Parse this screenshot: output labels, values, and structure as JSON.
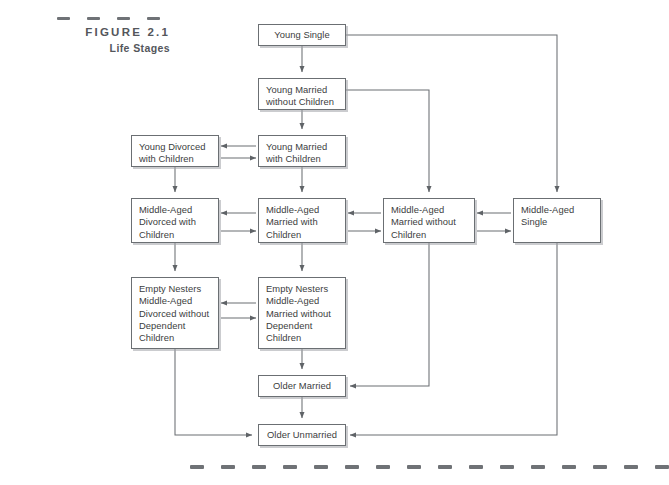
{
  "figure": {
    "label": "FIGURE 2.1",
    "title": "Life Stages"
  },
  "decor": {
    "top_rule_dashes": 4,
    "bottom_rule_dashes": 16,
    "dash_color": "#6f7276"
  },
  "theme": {
    "box_border": "#6b6f73",
    "box_shadow": "#a0a3a7",
    "text": "#3b3d40",
    "connector": "#6b6f73",
    "background": "#ffffff"
  },
  "diagram": {
    "type": "flowchart",
    "title": "Life Stages",
    "nodes": [
      {
        "id": "young-single",
        "label": "Young Single",
        "lines": [
          "Young Single"
        ],
        "x": 258,
        "y": 24,
        "w": 88,
        "h": 22,
        "align": "center"
      },
      {
        "id": "young-married-without-children",
        "label": "Young Married without Children",
        "lines": [
          "Young Married",
          "without Children"
        ],
        "x": 258,
        "y": 78,
        "w": 88,
        "h": 32,
        "align": "left"
      },
      {
        "id": "young-married-with-children",
        "label": "Young Married with Children",
        "lines": [
          "Young Married",
          "with Children"
        ],
        "x": 258,
        "y": 135,
        "w": 88,
        "h": 32,
        "align": "left"
      },
      {
        "id": "young-divorced-with-children",
        "label": "Young Divorced with Children",
        "lines": [
          "Young Divorced",
          "with Children"
        ],
        "x": 131,
        "y": 135,
        "w": 88,
        "h": 32,
        "align": "left"
      },
      {
        "id": "middle-aged-divorced-with-children",
        "label": "Middle-Aged Divorced with Children",
        "lines": [
          "Middle-Aged",
          "Divorced with",
          "Children"
        ],
        "x": 131,
        "y": 198,
        "w": 88,
        "h": 45,
        "align": "left"
      },
      {
        "id": "middle-aged-married-with-children",
        "label": "Middle-Aged Married with Children",
        "lines": [
          "Middle-Aged",
          "Married with",
          "Children"
        ],
        "x": 258,
        "y": 198,
        "w": 88,
        "h": 45,
        "align": "left"
      },
      {
        "id": "middle-aged-married-without-children",
        "label": "Middle-Aged Married without Children",
        "lines": [
          "Middle-Aged",
          "Married without",
          "Children"
        ],
        "x": 383,
        "y": 198,
        "w": 92,
        "h": 45,
        "align": "left"
      },
      {
        "id": "middle-aged-single",
        "label": "Middle-Aged Single",
        "lines": [
          "Middle-Aged",
          "Single"
        ],
        "x": 513,
        "y": 198,
        "w": 88,
        "h": 45,
        "align": "left"
      },
      {
        "id": "empty-nesters-divorced",
        "label": "Empty Nesters Middle-Aged Divorced without Dependent Children",
        "lines": [
          "Empty Nesters",
          "Middle-Aged",
          "Divorced without",
          "Dependent",
          "Children"
        ],
        "x": 131,
        "y": 277,
        "w": 88,
        "h": 72,
        "align": "left"
      },
      {
        "id": "empty-nesters-married",
        "label": "Empty Nesters Middle-Aged Married without Dependent Children",
        "lines": [
          "Empty Nesters",
          "Middle-Aged",
          "Married without",
          "Dependent",
          "Children"
        ],
        "x": 258,
        "y": 277,
        "w": 88,
        "h": 72,
        "align": "left"
      },
      {
        "id": "older-married",
        "label": "Older Married",
        "lines": [
          "Older Married"
        ],
        "x": 258,
        "y": 375,
        "w": 88,
        "h": 22,
        "align": "center"
      },
      {
        "id": "older-unmarried",
        "label": "Older Unmarried",
        "lines": [
          "Older Unmarried"
        ],
        "x": 258,
        "y": 424,
        "w": 88,
        "h": 22,
        "align": "center"
      }
    ],
    "edges": [
      {
        "from": "young-single",
        "to": "young-married-without-children",
        "kind": "down"
      },
      {
        "from": "young-single",
        "to": "middle-aged-single",
        "kind": "right-then-down"
      },
      {
        "from": "young-married-without-children",
        "to": "young-married-with-children",
        "kind": "down"
      },
      {
        "from": "young-married-without-children",
        "to": "middle-aged-married-without-children",
        "kind": "right-then-down"
      },
      {
        "from": "young-married-with-children",
        "to": "young-divorced-with-children",
        "kind": "bidirectional-horizontal"
      },
      {
        "from": "young-married-with-children",
        "to": "middle-aged-married-with-children",
        "kind": "down"
      },
      {
        "from": "young-divorced-with-children",
        "to": "middle-aged-divorced-with-children",
        "kind": "down"
      },
      {
        "from": "middle-aged-married-with-children",
        "to": "middle-aged-divorced-with-children",
        "kind": "bidirectional-horizontal"
      },
      {
        "from": "middle-aged-married-without-children",
        "to": "middle-aged-married-with-children",
        "kind": "bidirectional-horizontal"
      },
      {
        "from": "middle-aged-single",
        "to": "middle-aged-married-without-children",
        "kind": "bidirectional-horizontal"
      },
      {
        "from": "middle-aged-divorced-with-children",
        "to": "empty-nesters-divorced",
        "kind": "down"
      },
      {
        "from": "middle-aged-married-with-children",
        "to": "empty-nesters-married",
        "kind": "down"
      },
      {
        "from": "empty-nesters-married",
        "to": "empty-nesters-divorced",
        "kind": "bidirectional-horizontal"
      },
      {
        "from": "empty-nesters-married",
        "to": "older-married",
        "kind": "down"
      },
      {
        "from": "middle-aged-married-without-children",
        "to": "older-married",
        "kind": "down-then-left"
      },
      {
        "from": "older-married",
        "to": "older-unmarried",
        "kind": "down"
      },
      {
        "from": "empty-nesters-divorced",
        "to": "older-unmarried",
        "kind": "down-then-right"
      },
      {
        "from": "middle-aged-single",
        "to": "older-unmarried",
        "kind": "down-then-left"
      }
    ]
  }
}
